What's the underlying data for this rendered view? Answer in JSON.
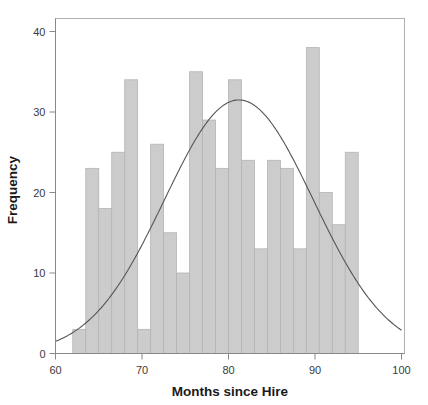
{
  "chart_data": {
    "type": "bar",
    "subtype": "histogram-with-normal-curve",
    "title": "",
    "xlabel": "Months since Hire",
    "ylabel": "Frequency",
    "xlim": [
      60,
      100
    ],
    "ylim": [
      0,
      42
    ],
    "xticks": [
      60,
      70,
      80,
      90,
      100
    ],
    "xtick_labels": [
      "60",
      "70",
      "80",
      "90",
      "100"
    ],
    "yticks": [
      0,
      10,
      20,
      30,
      40
    ],
    "ytick_labels": [
      "0",
      "10",
      "20",
      "30",
      "40"
    ],
    "grid": false,
    "legend": false,
    "bin_width": 1.5,
    "bin_start": 62,
    "bin_edges": [
      62,
      63.5,
      65,
      66.5,
      68,
      69.5,
      71,
      72.5,
      74,
      75.5,
      77,
      78.5,
      80,
      81.5,
      83,
      84.5,
      86,
      87.5,
      89,
      90.5,
      92,
      93.5,
      95,
      96.5,
      98
    ],
    "bin_centers": [
      62.75,
      64.25,
      65.75,
      67.25,
      68.75,
      70.25,
      71.75,
      73.25,
      74.75,
      76.25,
      77.75,
      79.25,
      80.75,
      82.25,
      83.75,
      85.25,
      86.75,
      88.25,
      89.75,
      91.25,
      92.75,
      94.25,
      95.75,
      97.25
    ],
    "values": [
      3,
      23,
      18,
      25,
      34,
      3,
      26,
      15,
      10,
      35,
      29,
      23,
      34,
      24,
      13,
      24,
      23,
      13,
      38,
      20,
      16,
      25
    ],
    "bars": [
      {
        "x0": 62.0,
        "x1": 63.5,
        "frequency": 3
      },
      {
        "x0": 63.5,
        "x1": 65.0,
        "frequency": 23
      },
      {
        "x0": 65.0,
        "x1": 66.5,
        "frequency": 18
      },
      {
        "x0": 66.5,
        "x1": 68.0,
        "frequency": 25
      },
      {
        "x0": 68.0,
        "x1": 69.5,
        "frequency": 34
      },
      {
        "x0": 69.5,
        "x1": 71.0,
        "frequency": 3
      },
      {
        "x0": 71.0,
        "x1": 72.5,
        "frequency": 26
      },
      {
        "x0": 72.5,
        "x1": 74.0,
        "frequency": 15
      },
      {
        "x0": 74.0,
        "x1": 75.5,
        "frequency": 10
      },
      {
        "x0": 75.5,
        "x1": 77.0,
        "frequency": 35
      },
      {
        "x0": 77.0,
        "x1": 78.5,
        "frequency": 29
      },
      {
        "x0": 78.5,
        "x1": 80.0,
        "frequency": 23
      },
      {
        "x0": 80.0,
        "x1": 81.5,
        "frequency": 34
      },
      {
        "x0": 81.5,
        "x1": 83.0,
        "frequency": 24
      },
      {
        "x0": 83.0,
        "x1": 84.5,
        "frequency": 13
      },
      {
        "x0": 84.5,
        "x1": 86.0,
        "frequency": 24
      },
      {
        "x0": 86.0,
        "x1": 87.5,
        "frequency": 23
      },
      {
        "x0": 87.5,
        "x1": 89.0,
        "frequency": 13
      },
      {
        "x0": 89.0,
        "x1": 90.5,
        "frequency": 38
      },
      {
        "x0": 90.5,
        "x1": 92.0,
        "frequency": 20
      },
      {
        "x0": 92.0,
        "x1": 93.5,
        "frequency": 16
      },
      {
        "x0": 93.5,
        "x1": 95.0,
        "frequency": 25
      }
    ],
    "overlay_curve": {
      "name": "normal-fit",
      "type": "line",
      "mean": 81.2,
      "sigma": 8.6,
      "peak_value": 31.5,
      "endpoints": [
        {
          "x": 60.0,
          "y": 3.4
        },
        {
          "x": 100.0,
          "y": 3.4
        }
      ]
    },
    "colors": {
      "bar_fill": "#cccccc",
      "bar_stroke": "#b4b4b4",
      "curve": "#555555",
      "axis": "#888888",
      "frame": "#b0b0b0",
      "text": "#1a1a1a",
      "background": "#ffffff"
    }
  }
}
